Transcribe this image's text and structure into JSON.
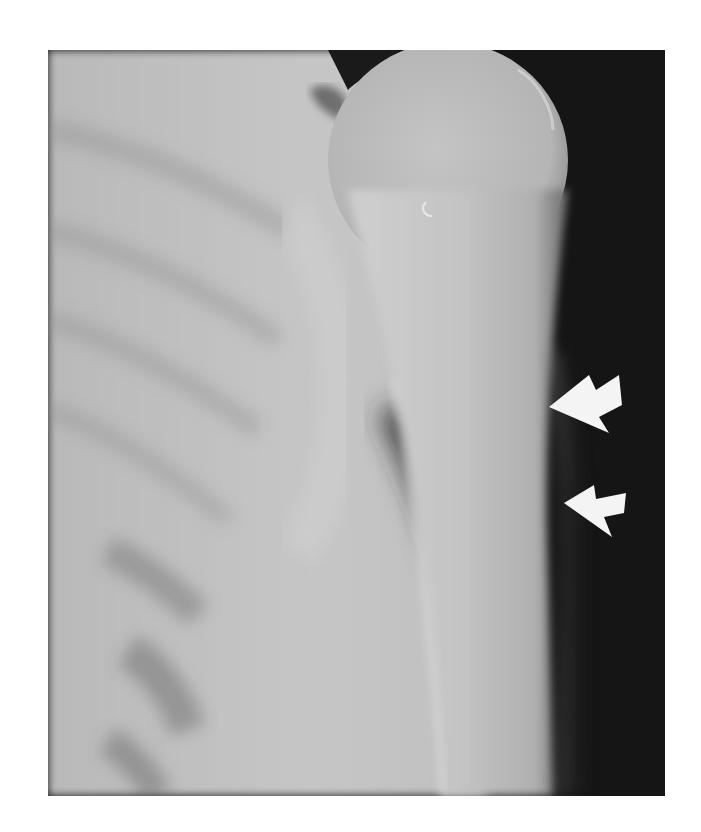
{
  "image": {
    "type": "radiograph",
    "subject": "shoulder and proximal humerus, frontal view",
    "annotations": [
      {
        "id": "arrow-upper",
        "shape": "arrow",
        "color": "#f4f4f4",
        "points_toward": "lateral humeral cortex",
        "approx_position": [
          568,
          398
        ]
      },
      {
        "id": "arrow-lower",
        "shape": "arrow",
        "color": "#f4f4f4",
        "points_toward": "lateral humeral cortex",
        "approx_position": [
          586,
          493
        ]
      }
    ]
  },
  "colors": {
    "background": "#ffffff",
    "soft_tissue_dark": "#141414",
    "bone_light": "#c8c8c8",
    "thorax": "#bdbdbd",
    "arrow": "#f4f4f4"
  }
}
